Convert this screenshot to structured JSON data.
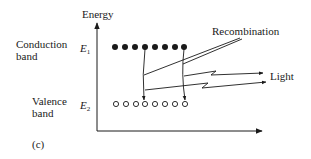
{
  "figure": {
    "panel_label": "(c)",
    "y_axis_label": "Energy",
    "levels": {
      "upper": {
        "band_label_line1": "Conduction",
        "band_label_line2": "band",
        "symbol": "E",
        "subscript": "1",
        "particles": "filled",
        "count": 8
      },
      "lower": {
        "band_label_line1": "Valence",
        "band_label_line2": "band",
        "symbol": "E",
        "subscript": "2",
        "particles": "hollow",
        "count": 8
      }
    },
    "annotations": {
      "recombination": "Recombination",
      "light": "Light"
    },
    "transitions": [
      {
        "from_index": 4,
        "to_index": 4
      },
      {
        "from_index": 8,
        "to_index": 8
      }
    ],
    "colors": {
      "ink": "#1a1a1a",
      "background": "#ffffff"
    }
  }
}
